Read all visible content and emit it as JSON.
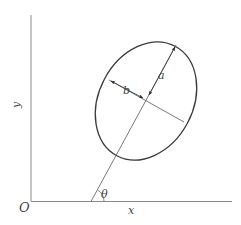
{
  "figure": {
    "labels": {
      "origin": "O",
      "x_axis": "x",
      "y_axis": "y",
      "semi_major": "a",
      "semi_minor": "b",
      "angle": "θ"
    },
    "colors": {
      "background": "#ffffff",
      "axes": "#8a8a8a",
      "ellipse": "#3a3a3a",
      "lines": "#6a6a6a",
      "text": "#444444"
    }
  }
}
